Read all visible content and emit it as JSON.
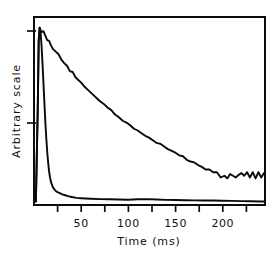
{
  "figure": {
    "name": "decay-curves-figure",
    "background_color": "#ffffff",
    "line_color": "#0a0a0a",
    "plot_frame": {
      "left": 34,
      "top": 17,
      "right": 265,
      "bottom": 205
    }
  },
  "chart_data": {
    "type": "line",
    "title": "",
    "subtitle": "",
    "xlabel": "Time (ms)",
    "ylabel": "Arbitrary scale",
    "xlim": [
      0,
      245
    ],
    "ylim": [
      0,
      1.06
    ],
    "grid": false,
    "legend": null,
    "legend_position": "none",
    "x_ticks_major": [
      50,
      100,
      150,
      200
    ],
    "x_ticks_minor": [
      25,
      75,
      125,
      175,
      225
    ],
    "x_tick_labels": [
      "50",
      "100",
      "150",
      "200"
    ],
    "y_ticks": [
      0.38,
      1.0
    ],
    "y_tick_labels": [
      "",
      ""
    ],
    "annotations": [],
    "series": [
      {
        "name": "slow-decay",
        "x": [
          2,
          4,
          5,
          6,
          7,
          8,
          10,
          12,
          14,
          16,
          18,
          20,
          23,
          26,
          29,
          32,
          35,
          38,
          41,
          44,
          47,
          50,
          54,
          58,
          62,
          66,
          70,
          74,
          78,
          82,
          86,
          90,
          94,
          98,
          102,
          106,
          110,
          114,
          118,
          122,
          126,
          130,
          134,
          138,
          142,
          146,
          150,
          154,
          158,
          162,
          166,
          170,
          174,
          178,
          182,
          186,
          190,
          194,
          198,
          202,
          205,
          208,
          211,
          214,
          217,
          220,
          223,
          226,
          229,
          232,
          235,
          238,
          241,
          244
        ],
        "y": [
          0.02,
          0.55,
          0.93,
          1.0,
          0.985,
          0.975,
          0.98,
          0.955,
          0.93,
          0.925,
          0.9,
          0.88,
          0.865,
          0.85,
          0.82,
          0.8,
          0.785,
          0.755,
          0.75,
          0.72,
          0.705,
          0.69,
          0.665,
          0.645,
          0.625,
          0.605,
          0.585,
          0.57,
          0.55,
          0.535,
          0.51,
          0.495,
          0.475,
          0.465,
          0.45,
          0.43,
          0.42,
          0.405,
          0.39,
          0.38,
          0.365,
          0.35,
          0.345,
          0.33,
          0.315,
          0.305,
          0.295,
          0.28,
          0.275,
          0.255,
          0.245,
          0.24,
          0.225,
          0.215,
          0.2,
          0.2,
          0.185,
          0.185,
          0.155,
          0.165,
          0.15,
          0.175,
          0.165,
          0.155,
          0.17,
          0.18,
          0.165,
          0.185,
          0.155,
          0.185,
          0.15,
          0.185,
          0.155,
          0.18
        ],
        "noise_note": "amplitude of random fluctuation grows with time"
      },
      {
        "name": "fast-decay",
        "x": [
          2,
          4,
          5,
          6,
          7,
          8,
          9,
          10,
          11,
          12,
          13,
          14,
          15,
          16,
          17,
          18,
          19,
          20,
          22,
          24,
          26,
          28,
          30,
          33,
          36,
          40,
          45,
          50,
          60,
          70,
          80,
          90,
          100,
          110,
          120,
          130,
          140,
          150,
          160,
          170,
          180,
          190,
          200,
          210,
          220,
          230,
          240,
          244
        ],
        "y": [
          0.02,
          0.55,
          0.93,
          1.0,
          0.97,
          0.9,
          0.8,
          0.69,
          0.58,
          0.47,
          0.38,
          0.3,
          0.24,
          0.19,
          0.155,
          0.13,
          0.115,
          0.1,
          0.085,
          0.075,
          0.07,
          0.065,
          0.06,
          0.055,
          0.05,
          0.045,
          0.04,
          0.038,
          0.035,
          0.033,
          0.032,
          0.031,
          0.03,
          0.032,
          0.033,
          0.031,
          0.029,
          0.028,
          0.027,
          0.026,
          0.025,
          0.025,
          0.024,
          0.023,
          0.022,
          0.021,
          0.02,
          0.02
        ],
        "noise_note": "smooth near-exponential fall to a flat baseline"
      }
    ]
  }
}
